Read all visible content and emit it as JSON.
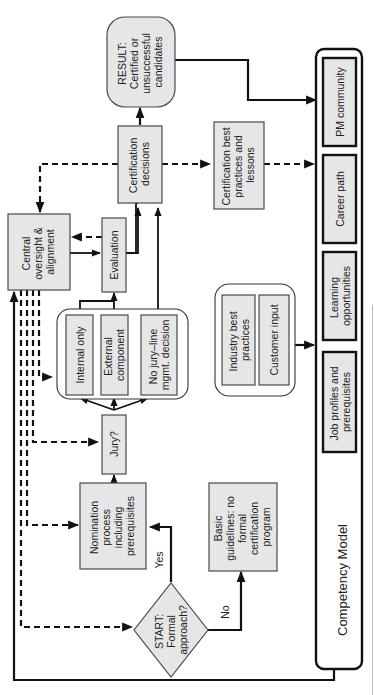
{
  "diagram": {
    "orientation": "rotated-90-ccw",
    "nodes": {
      "start": "START: Formal approach?",
      "basic_guidelines": "Basic guidelines: no formal certification program",
      "nomination": "Nomination process including prerequisites",
      "jury": "Jury?",
      "internal_only": "Internal only",
      "external_component": "External component",
      "no_jury": "No jury–line mgmt. decision",
      "evaluation": "Evaluation",
      "central_oversight": "Central oversight & alignment",
      "certification_decisions": "Certification decisions",
      "result": "RESULT: Certified or unsuccessful candidates",
      "cert_best_practices": "Certification best practices and lessons",
      "industry_best_practices": "Industry best practices",
      "customer_input": "Customer input",
      "competency_model": "Competency Model",
      "job_profiles": "Job profiles and prerequisites",
      "learning_opportunities": "Learning opportunities",
      "career_path": "Career path",
      "pm_community": "PM community"
    },
    "edge_labels": {
      "yes": "Yes",
      "no": "No"
    },
    "lines": {
      "start": [
        "START:",
        "Formal",
        "approach?"
      ],
      "basic_guidelines": [
        "Basic",
        "guidelines: no",
        "formal",
        "certification",
        "program"
      ],
      "nomination": [
        "Nomination",
        "process",
        "including",
        "prerequisites"
      ],
      "jury": [
        "Jury?"
      ],
      "internal_only": [
        "Internal only"
      ],
      "external_component": [
        "External",
        "component"
      ],
      "no_jury": [
        "No jury–line",
        "mgmt. decision"
      ],
      "evaluation": [
        "Evaluation"
      ],
      "central_oversight": [
        "Central",
        "oversight &",
        "alignment"
      ],
      "certification_decisions": [
        "Certification",
        "decisions"
      ],
      "result": [
        "RESULT:",
        "Certified or",
        "unsuccessful",
        "candidates"
      ],
      "cert_best_practices": [
        "Certification best",
        "practices and",
        "lessons"
      ],
      "industry_best_practices": [
        "Industry best",
        "practices"
      ],
      "customer_input": [
        "Customer input"
      ],
      "competency_model": [
        "Competency Model"
      ],
      "job_profiles": [
        "Job profiles and",
        "prerequisites"
      ],
      "learning_opportunities": [
        "Learning",
        "opportunities"
      ],
      "career_path": [
        "Career path"
      ],
      "pm_community": [
        "PM community"
      ]
    }
  }
}
